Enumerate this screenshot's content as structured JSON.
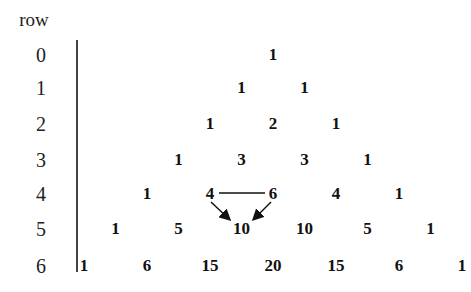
{
  "header": {
    "label": "row"
  },
  "rows": [
    {
      "index": "0",
      "values": [
        "1"
      ]
    },
    {
      "index": "1",
      "values": [
        "1",
        "1"
      ]
    },
    {
      "index": "2",
      "values": [
        "1",
        "2",
        "1"
      ]
    },
    {
      "index": "3",
      "values": [
        "1",
        "3",
        "3",
        "1"
      ]
    },
    {
      "index": "4",
      "values": [
        "1",
        "4",
        "6",
        "4",
        "1"
      ]
    },
    {
      "index": "5",
      "values": [
        "1",
        "5",
        "10",
        "10",
        "5",
        "1"
      ]
    },
    {
      "index": "6",
      "values": [
        "1",
        "6",
        "15",
        "20",
        "15",
        "6",
        "1"
      ]
    }
  ],
  "annotation": {
    "description": "4 and 6 connected by a line, arrows pointing down to 10",
    "from": [
      "4",
      "6"
    ],
    "to": "10"
  },
  "colors": {
    "text": "#111111",
    "axis": "#444444"
  }
}
